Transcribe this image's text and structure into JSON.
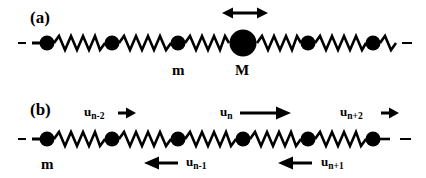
{
  "figure": {
    "background_color": "#ffffff",
    "ink_color": "#000000"
  },
  "panel_a": {
    "label": "(a)",
    "mass_small_label": "m",
    "mass_large_label": "M",
    "arrow_name": "double-headed-arrow",
    "masses": [
      {
        "cx": 47,
        "r": 7.5,
        "kind": "small"
      },
      {
        "cx": 112,
        "r": 7.5,
        "kind": "small"
      },
      {
        "cx": 178,
        "r": 7.5,
        "kind": "small"
      },
      {
        "cx": 243,
        "r": 13.5,
        "kind": "large"
      },
      {
        "cx": 308,
        "r": 7.5,
        "kind": "small"
      },
      {
        "cx": 373,
        "r": 7.5,
        "kind": "small"
      }
    ],
    "baseline_y": 43,
    "left_dash": "–",
    "right_dash": "–"
  },
  "panel_b": {
    "label": "(b)",
    "mass_small_label": "m",
    "masses": [
      {
        "cx": 47,
        "r": 7.5,
        "kind": "small"
      },
      {
        "cx": 112,
        "r": 7.5,
        "kind": "small"
      },
      {
        "cx": 178,
        "r": 7.5,
        "kind": "small"
      },
      {
        "cx": 243,
        "r": 7.5,
        "kind": "small"
      },
      {
        "cx": 308,
        "r": 7.5,
        "kind": "small"
      },
      {
        "cx": 373,
        "r": 7.5,
        "kind": "small"
      }
    ],
    "baseline_y": 139,
    "left_dash": "–",
    "right_dash": "–",
    "displacements": [
      {
        "name": "u-n-minus-2",
        "base": "u",
        "sub": "n-2",
        "direction": "right",
        "position": "above",
        "arrow_length": 22
      },
      {
        "name": "u-n",
        "base": "u",
        "sub": "n",
        "direction": "right",
        "position": "above",
        "arrow_length": 52
      },
      {
        "name": "u-n-plus-2",
        "base": "u",
        "sub": "n+2",
        "direction": "right",
        "position": "above",
        "arrow_length": 22
      },
      {
        "name": "u-n-minus-1",
        "base": "u",
        "sub": "n-1",
        "direction": "left",
        "position": "below",
        "arrow_length": 34
      },
      {
        "name": "u-n-plus-1",
        "base": "u",
        "sub": "n+1",
        "direction": "left",
        "position": "below",
        "arrow_length": 34
      }
    ]
  }
}
